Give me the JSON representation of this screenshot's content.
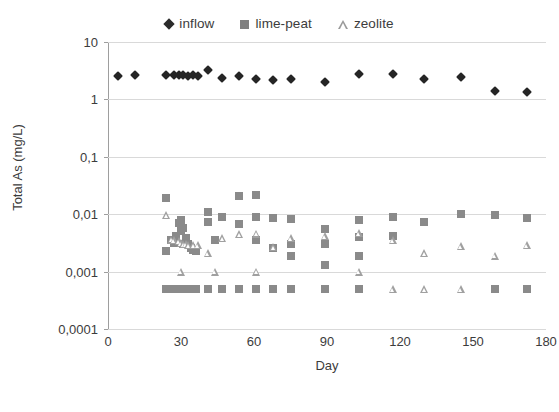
{
  "chart_data": {
    "type": "scatter",
    "title": "",
    "xlabel": "Day",
    "ylabel": "Total As (mg/L)",
    "yscale": "log",
    "ylim": [
      0.0001,
      10
    ],
    "xlim": [
      0,
      180
    ],
    "grid": true,
    "legend_position": "top-center",
    "decimal_separator": ",",
    "xticks": [
      "0",
      "30",
      "60",
      "90",
      "120",
      "150",
      "180"
    ],
    "xtick_values": [
      0,
      30,
      60,
      90,
      120,
      150,
      180
    ],
    "yticks": [
      "10",
      "1",
      "0,1",
      "0,01",
      "0,001",
      "0,0001"
    ],
    "ytick_values": [
      10,
      1,
      0.1,
      0.01,
      0.001,
      0.0001
    ],
    "series": [
      {
        "name": "inflow",
        "marker": "filled-diamond",
        "color": "#252525",
        "points": [
          [
            4,
            2.55
          ],
          [
            11,
            2.7
          ],
          [
            24,
            2.65
          ],
          [
            27,
            2.65
          ],
          [
            29,
            2.7
          ],
          [
            31,
            2.65
          ],
          [
            33,
            2.6
          ],
          [
            35,
            2.7
          ],
          [
            37,
            2.6
          ],
          [
            41,
            3.3
          ],
          [
            47,
            2.4
          ],
          [
            54,
            2.6
          ],
          [
            61,
            2.25
          ],
          [
            68,
            2.2
          ],
          [
            75,
            2.25
          ],
          [
            89,
            2.0
          ],
          [
            103,
            2.8
          ],
          [
            117,
            2.75
          ],
          [
            130,
            2.3
          ],
          [
            145,
            2.5
          ],
          [
            159,
            1.4
          ],
          [
            172,
            1.35
          ]
        ]
      },
      {
        "name": "lime-peat",
        "marker": "filled-square",
        "color": "#8a8a8a",
        "points": [
          [
            24,
            0.019
          ],
          [
            24,
            0.0023
          ],
          [
            26,
            0.0035
          ],
          [
            27,
            0.0031
          ],
          [
            28,
            0.0042
          ],
          [
            29,
            0.007
          ],
          [
            30,
            0.008
          ],
          [
            30,
            0.005
          ],
          [
            31,
            0.0058
          ],
          [
            31,
            0.003
          ],
          [
            32,
            0.0038
          ],
          [
            33,
            0.003
          ],
          [
            34,
            0.0026
          ],
          [
            35,
            0.0024
          ],
          [
            36,
            0.0023
          ],
          [
            41,
            0.011
          ],
          [
            41,
            0.0072
          ],
          [
            44,
            0.0035
          ],
          [
            47,
            0.009
          ],
          [
            54,
            0.021
          ],
          [
            54,
            0.0068
          ],
          [
            61,
            0.0215
          ],
          [
            61,
            0.0088
          ],
          [
            61,
            0.0035
          ],
          [
            68,
            0.0086
          ],
          [
            68,
            0.0026
          ],
          [
            75,
            0.0084
          ],
          [
            75,
            0.003
          ],
          [
            75,
            0.0019
          ],
          [
            89,
            0.0056
          ],
          [
            89,
            0.003
          ],
          [
            89,
            0.0013
          ],
          [
            103,
            0.0079
          ],
          [
            103,
            0.004
          ],
          [
            103,
            0.0019
          ],
          [
            117,
            0.009
          ],
          [
            117,
            0.0041
          ],
          [
            130,
            0.0073
          ],
          [
            145,
            0.01
          ],
          [
            159,
            0.0098
          ],
          [
            172,
            0.0085
          ],
          [
            24,
            0.0005
          ],
          [
            26,
            0.0005
          ],
          [
            28,
            0.0005
          ],
          [
            30,
            0.0005
          ],
          [
            32,
            0.0005
          ],
          [
            34,
            0.0005
          ],
          [
            36,
            0.0005
          ],
          [
            41,
            0.0005
          ],
          [
            47,
            0.0005
          ],
          [
            54,
            0.0005
          ],
          [
            61,
            0.0005
          ],
          [
            68,
            0.0005
          ],
          [
            75,
            0.0005
          ],
          [
            89,
            0.0005
          ],
          [
            103,
            0.0005
          ],
          [
            159,
            0.0005
          ],
          [
            172,
            0.0005
          ]
        ]
      },
      {
        "name": "zeolite",
        "marker": "open-triangle",
        "color": "#a0a0a0",
        "points": [
          [
            24,
            0.0098
          ],
          [
            26,
            0.0036
          ],
          [
            27,
            0.0035
          ],
          [
            29,
            0.0034
          ],
          [
            30,
            0.0031
          ],
          [
            31,
            0.003
          ],
          [
            32,
            0.003
          ],
          [
            33,
            0.0029
          ],
          [
            35,
            0.0029
          ],
          [
            37,
            0.0029
          ],
          [
            41,
            0.0021
          ],
          [
            47,
            0.0038
          ],
          [
            54,
            0.0045
          ],
          [
            61,
            0.0046
          ],
          [
            68,
            0.0027
          ],
          [
            75,
            0.0038
          ],
          [
            89,
            0.0041
          ],
          [
            103,
            0.0047
          ],
          [
            117,
            0.0035
          ],
          [
            130,
            0.0021
          ],
          [
            145,
            0.0028
          ],
          [
            159,
            0.0019
          ],
          [
            172,
            0.0029
          ],
          [
            30,
            0.001
          ],
          [
            44,
            0.001
          ],
          [
            61,
            0.001
          ],
          [
            103,
            0.001
          ],
          [
            117,
            0.0005
          ],
          [
            130,
            0.0005
          ],
          [
            145,
            0.0005
          ]
        ]
      }
    ]
  },
  "legend": {
    "entries": [
      {
        "label": "inflow",
        "marker": "filled-diamond"
      },
      {
        "label": "lime-peat",
        "marker": "filled-square"
      },
      {
        "label": "zeolite",
        "marker": "open-triangle"
      }
    ]
  },
  "axes": {
    "x_title": "Day",
    "y_title": "Total As (mg/L)"
  },
  "colors": {
    "inflow": "#252525",
    "lime_peat": "#8a8a8a",
    "zeolite": "#a0a0a0",
    "grid": "#d9d9d9",
    "axis": "#9e9e9e",
    "text": "#3c3c3c",
    "background": "#ffffff"
  }
}
